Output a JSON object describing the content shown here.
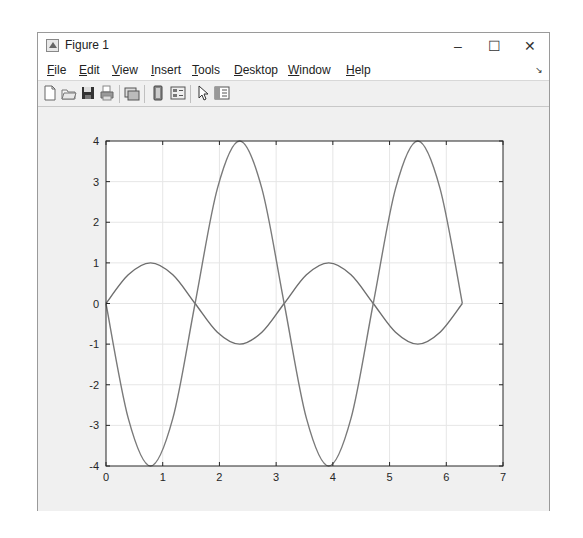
{
  "window": {
    "title": "Figure 1",
    "controls": {
      "minimize": "–",
      "maximize": "☐",
      "close": "✕"
    }
  },
  "menubar": {
    "items": [
      {
        "label": "File",
        "mnemonic": "F"
      },
      {
        "label": "Edit",
        "mnemonic": "E"
      },
      {
        "label": "View",
        "mnemonic": "V"
      },
      {
        "label": "Insert",
        "mnemonic": "I"
      },
      {
        "label": "Tools",
        "mnemonic": "T"
      },
      {
        "label": "Desktop",
        "mnemonic": "D"
      },
      {
        "label": "Window",
        "mnemonic": "W"
      },
      {
        "label": "Help",
        "mnemonic": "H"
      }
    ],
    "dock_arrow": "↘"
  },
  "toolbar": {
    "buttons": [
      {
        "name": "new-figure",
        "icon": "new-file-icon"
      },
      {
        "name": "open-file",
        "icon": "folder-open-icon"
      },
      {
        "name": "save-figure",
        "icon": "save-icon"
      },
      {
        "name": "print-figure",
        "icon": "print-icon"
      },
      {
        "name": "link-plot",
        "icon": "link-plot-icon"
      },
      {
        "name": "insert-colorbar",
        "icon": "colorbar-icon"
      },
      {
        "name": "insert-legend",
        "icon": "legend-icon"
      },
      {
        "name": "edit-plot",
        "icon": "pointer-icon"
      },
      {
        "name": "open-property-inspector",
        "icon": "property-inspector-icon"
      }
    ]
  },
  "chart_data": {
    "type": "line",
    "title": "",
    "xlabel": "",
    "ylabel": "",
    "xlim": [
      0,
      7
    ],
    "ylim": [
      -4,
      4
    ],
    "xticks": [
      0,
      1,
      2,
      3,
      4,
      5,
      6,
      7
    ],
    "yticks": [
      -4,
      -3,
      -2,
      -1,
      0,
      1,
      2,
      3,
      4
    ],
    "xtick_labels": [
      "0",
      "1",
      "2",
      "3",
      "4",
      "5",
      "6",
      "7"
    ],
    "ytick_labels": [
      "-4",
      "-3",
      "-2",
      "-1",
      "0",
      "1",
      "2",
      "3",
      "4"
    ],
    "grid": true,
    "legend": null,
    "series": [
      {
        "name": "sin(2x)",
        "color": "#6e6e6e",
        "x": [
          0,
          0.3927,
          0.7854,
          1.1781,
          1.5708,
          1.9635,
          2.3562,
          2.7489,
          3.1416,
          3.5343,
          3.927,
          4.3197,
          4.7124,
          5.1051,
          5.4978,
          5.8905,
          6.2832
        ],
        "y": [
          0,
          0.707,
          1,
          0.707,
          0,
          -0.707,
          -1,
          -0.707,
          0,
          0.707,
          1,
          0.707,
          0,
          -0.707,
          -1,
          -0.707,
          0
        ]
      },
      {
        "name": "-4sin(2x)",
        "color": "#7a7a7a",
        "x": [
          0,
          0.3927,
          0.7854,
          1.1781,
          1.5708,
          1.9635,
          2.3562,
          2.7489,
          3.1416,
          3.5343,
          3.927,
          4.3197,
          4.7124,
          5.1051,
          5.4978,
          5.8905,
          6.2832
        ],
        "y": [
          0,
          -2.828,
          -4,
          -2.828,
          0,
          2.828,
          4,
          2.828,
          0,
          -2.828,
          -4,
          -2.828,
          0,
          2.828,
          4,
          2.828,
          0
        ]
      }
    ],
    "axes_color": "#262626",
    "grid_color": "#e6e6e6"
  }
}
